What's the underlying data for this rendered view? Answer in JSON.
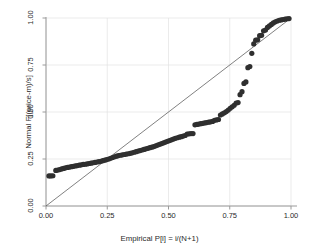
{
  "chart_data": {
    "type": "scatter",
    "title": "",
    "xlabel": "Empirical P[i] = i/(N+1)",
    "ylabel": "Normal F[(price-m)/s]",
    "xlim": [
      0.0,
      1.0
    ],
    "ylim": [
      0.0,
      1.0
    ],
    "grid": true,
    "legend": "none",
    "xticks": [
      "0.00",
      "0.25",
      "0.50",
      "0.75",
      "1.00"
    ],
    "xtick_values": [
      0.0,
      0.25,
      0.5,
      0.75,
      1.0
    ],
    "yticks": [
      "0.00",
      "0.25",
      "0.50",
      "0.75",
      "1.00"
    ],
    "ytick_values": [
      0.0,
      0.25,
      0.5,
      0.75,
      1.0
    ],
    "marker_color": "#2f2f2f",
    "marker_size": 2.6,
    "reference_line": {
      "name": "45-degree reference line",
      "from": [
        0.0,
        0.0
      ],
      "to": [
        1.0,
        1.0
      ],
      "color": "#4a4a4a",
      "width": 0.7
    },
    "series": [
      {
        "name": "Normal quantile points",
        "x": [
          0.012,
          0.02,
          0.028,
          0.04,
          0.048,
          0.056,
          0.064,
          0.072,
          0.08,
          0.088,
          0.096,
          0.104,
          0.112,
          0.12,
          0.128,
          0.136,
          0.144,
          0.152,
          0.16,
          0.168,
          0.176,
          0.184,
          0.192,
          0.2,
          0.208,
          0.216,
          0.224,
          0.232,
          0.24,
          0.248,
          0.256,
          0.264,
          0.272,
          0.28,
          0.288,
          0.296,
          0.304,
          0.312,
          0.32,
          0.328,
          0.336,
          0.344,
          0.352,
          0.36,
          0.368,
          0.376,
          0.384,
          0.392,
          0.4,
          0.408,
          0.416,
          0.424,
          0.432,
          0.44,
          0.448,
          0.456,
          0.464,
          0.472,
          0.48,
          0.488,
          0.496,
          0.504,
          0.512,
          0.52,
          0.528,
          0.536,
          0.544,
          0.552,
          0.56,
          0.568,
          0.576,
          0.584,
          0.592,
          0.6,
          0.608,
          0.616,
          0.624,
          0.632,
          0.64,
          0.648,
          0.656,
          0.664,
          0.672,
          0.68,
          0.688,
          0.696,
          0.704,
          0.712,
          0.72,
          0.728,
          0.736,
          0.744,
          0.752,
          0.76,
          0.768,
          0.776,
          0.784,
          0.792,
          0.8,
          0.808,
          0.816,
          0.824,
          0.832,
          0.84,
          0.848,
          0.856,
          0.864,
          0.872,
          0.88,
          0.888,
          0.896,
          0.904,
          0.912,
          0.92,
          0.928,
          0.936,
          0.944,
          0.952,
          0.96,
          0.968,
          0.976,
          0.984,
          0.992
        ],
        "y": [
          0.16,
          0.16,
          0.161,
          0.189,
          0.191,
          0.194,
          0.197,
          0.2,
          0.203,
          0.205,
          0.207,
          0.209,
          0.211,
          0.213,
          0.215,
          0.217,
          0.219,
          0.221,
          0.222,
          0.224,
          0.226,
          0.228,
          0.23,
          0.232,
          0.234,
          0.236,
          0.238,
          0.241,
          0.244,
          0.247,
          0.25,
          0.254,
          0.258,
          0.262,
          0.265,
          0.268,
          0.27,
          0.272,
          0.274,
          0.276,
          0.278,
          0.28,
          0.283,
          0.286,
          0.289,
          0.292,
          0.295,
          0.298,
          0.301,
          0.304,
          0.307,
          0.31,
          0.313,
          0.316,
          0.32,
          0.324,
          0.328,
          0.332,
          0.336,
          0.34,
          0.344,
          0.348,
          0.352,
          0.356,
          0.36,
          0.363,
          0.366,
          0.369,
          0.372,
          0.375,
          0.383,
          0.384,
          0.385,
          0.385,
          0.432,
          0.434,
          0.436,
          0.438,
          0.44,
          0.442,
          0.444,
          0.446,
          0.448,
          0.45,
          0.456,
          0.458,
          0.46,
          0.484,
          0.49,
          0.496,
          0.502,
          0.51,
          0.52,
          0.528,
          0.536,
          0.548,
          0.55,
          0.592,
          0.608,
          0.652,
          0.66,
          0.736,
          0.742,
          0.812,
          0.862,
          0.882,
          0.884,
          0.906,
          0.908,
          0.932,
          0.936,
          0.95,
          0.958,
          0.966,
          0.974,
          0.98,
          0.984,
          0.988,
          0.99,
          0.992,
          0.994,
          0.996,
          0.997
        ]
      }
    ]
  }
}
